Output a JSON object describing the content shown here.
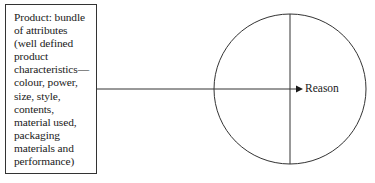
{
  "diagram": {
    "product_box": {
      "text": "Product: bundle\nof attributes\n(well defined\nproduct\ncharacteristics—\ncolour, power,\nsize, style,\ncontents,\nmaterial used,\npackaging\nmaterials and\nperformance)"
    },
    "target": {
      "label": "Reason"
    },
    "connector": {
      "from": "product_box",
      "to": "circle_center",
      "style": "arrow"
    },
    "circle": {
      "divided": "vertical-line"
    },
    "colors": {
      "stroke": "#333333",
      "text": "#1a1a1a",
      "background": "#ffffff"
    }
  }
}
